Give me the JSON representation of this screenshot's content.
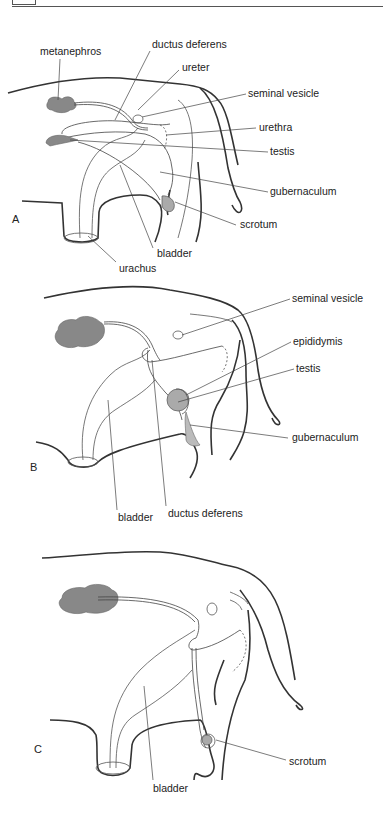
{
  "figure": {
    "panels": [
      {
        "id": "A",
        "label": "A",
        "labels": {
          "metanephros": "metanephros",
          "ductus_deferens": "ductus deferens",
          "ureter": "ureter",
          "seminal_vesicle": "seminal vesicle",
          "urethra": "urethra",
          "testis": "testis",
          "gubernaculum": "gubernaculum",
          "scrotum": "scrotum",
          "bladder": "bladder",
          "urachus": "urachus"
        }
      },
      {
        "id": "B",
        "label": "B",
        "labels": {
          "seminal_vesicle": "seminal vesicle",
          "epididymis": "epididymis",
          "testis": "testis",
          "gubernaculum": "gubernaculum",
          "bladder": "bladder",
          "ductus_deferens": "ductus deferens"
        }
      },
      {
        "id": "C",
        "label": "C",
        "labels": {
          "scrotum": "scrotum",
          "bladder": "bladder"
        }
      }
    ],
    "colors": {
      "organ_fill": "#888888",
      "testis_fill": "#aaaaaa",
      "line": "#333333"
    }
  }
}
